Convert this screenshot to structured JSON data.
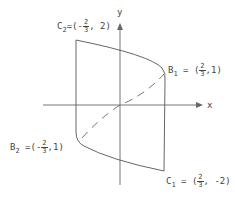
{
  "diagram": {
    "axes": {
      "x_label": "x",
      "y_label": "y"
    },
    "points": {
      "C2": {
        "name": "C",
        "sub": "2",
        "eq": "=(-",
        "num": "2",
        "den": "3",
        "rest": ", 2)"
      },
      "B1": {
        "name": "B",
        "sub": "1",
        "eq": " = (",
        "num": "2",
        "den": "3",
        "rest": ",1)"
      },
      "B2": {
        "name": "B",
        "sub": "2",
        "eq": " =(-",
        "num": "2",
        "den": "3",
        "rest": ",1)"
      },
      "C1": {
        "name": "C",
        "sub": "1",
        "eq": " = (",
        "num": "2",
        "den": "3",
        "rest": ",  -2)"
      }
    },
    "colors": {
      "stroke": "#555555",
      "text": "#444444"
    }
  }
}
